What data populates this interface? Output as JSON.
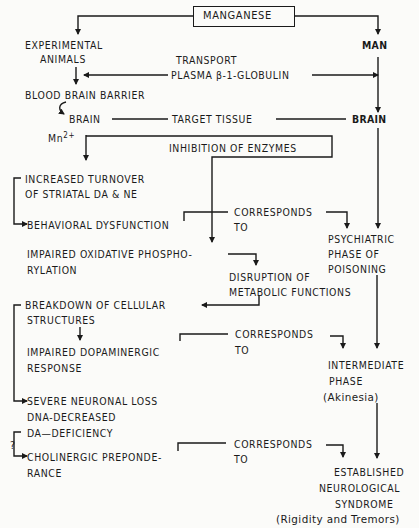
{
  "diagram": {
    "root": "MANGANESE",
    "left_branch": {
      "subject": [
        "EXPERIMENTAL",
        "ANIMALS"
      ],
      "barrier": "BLOOD BRAIN BARRIER",
      "brain": "BRAIN",
      "ion": "Mn",
      "ion_charge": "2+",
      "steps": {
        "increased_turnover": [
          "INCREASED TURNOVER",
          "OF STRIATAL DA & NE"
        ],
        "behavioral_dysfunction": "BEHAVIORAL DYSFUNCTION",
        "impaired_oxidative": [
          "IMPAIRED OXIDATIVE PHOSPHO-",
          "RYLATION"
        ],
        "disruption": [
          "DISRUPTION OF",
          "METABOLIC FUNCTIONS"
        ],
        "breakdown": [
          "BREAKDOWN OF CELLULAR",
          "STRUCTURES"
        ],
        "impaired_dopaminergic": [
          "IMPAIRED DOPAMINERGIC",
          "RESPONSE"
        ],
        "severe_loss": "SEVERE NEURONAL LOSS",
        "dna_decreased": "DNA-DECREASED",
        "da_deficiency": "DA—DEFICIENCY",
        "question": "?",
        "cholinergic": [
          "CHOLINERGIC PREPONDE-",
          "RANCE"
        ]
      }
    },
    "center": {
      "transport": "TRANSPORT",
      "plasma": "PLASMA β-1-GLOBULIN",
      "target_tissue": "TARGET TISSUE",
      "inhibition": "INHIBITION OF ENZYMES",
      "corresponds": [
        "CORRESPONDS",
        "TO"
      ]
    },
    "right_branch": {
      "subject": "MAN",
      "brain": "BRAIN",
      "psychiatric": [
        "PSYCHIATRIC",
        "PHASE OF",
        "POISONING"
      ],
      "intermediate": [
        "INTERMEDIATE",
        "PHASE",
        "(Akinesia)"
      ],
      "established": [
        "ESTABLISHED",
        "NEUROLOGICAL",
        "SYNDROME",
        "(Rigidity and Tremors)"
      ]
    }
  }
}
